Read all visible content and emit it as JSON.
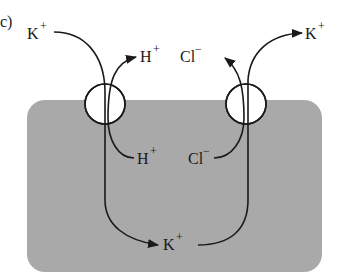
{
  "figure": {
    "panel_label": "c)",
    "colors": {
      "cell": "#a9a9a9",
      "stroke": "#1a1a1a",
      "background": "#ffffff"
    },
    "labels": {
      "k_outside_left": {
        "ion": "K",
        "charge": "+"
      },
      "h_outside": {
        "ion": "H",
        "charge": "+"
      },
      "cl_outside": {
        "ion": "Cl",
        "charge": "−"
      },
      "k_outside_right": {
        "ion": "K",
        "charge": "+"
      },
      "h_inside": {
        "ion": "H",
        "charge": "+"
      },
      "cl_inside": {
        "ion": "Cl",
        "charge": "−"
      },
      "k_inside": {
        "ion": "K",
        "charge": "+"
      }
    },
    "transporters": [
      {
        "name": "H+/K+ exchanger",
        "exchange": [
          "K+ in",
          "H+ out"
        ]
      },
      {
        "name": "K+/Cl- cotransporter",
        "exchange": [
          "K+ out",
          "Cl- out"
        ]
      }
    ]
  }
}
